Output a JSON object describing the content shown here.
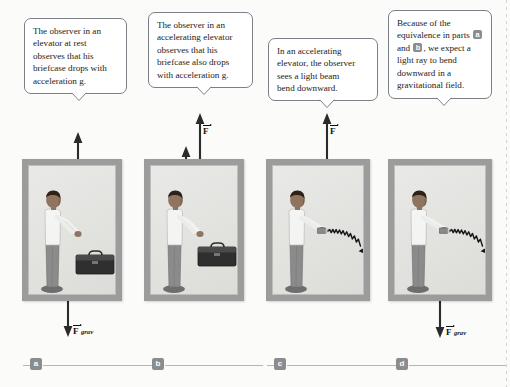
{
  "figure": {
    "background_color": "#fbfbfa",
    "frame_color": "#9c9c9c",
    "interior_color": "#e6e6e3",
    "badge_color": "#8c8c8c"
  },
  "callouts": [
    {
      "id": "callout-a",
      "text_lines": [
        "The observer in an",
        "elevator at rest",
        "observes that his",
        "briefcase drops with",
        "acceleration g."
      ],
      "plain_text": "The observer in an elevator at rest observes that his briefcase drops with acceleration g."
    },
    {
      "id": "callout-b",
      "text_lines": [
        "The observer in an",
        "accelerating elevator",
        "observes that his",
        "briefcase also drops",
        "with acceleration g."
      ],
      "plain_text": "The observer in an accelerating elevator observes that his briefcase also drops with acceleration g."
    },
    {
      "id": "callout-c",
      "text_lines": [
        "In an accelerating",
        "elevator, the observer",
        "sees a light beam",
        "bend downward."
      ],
      "plain_text": "In an accelerating elevator, the observer sees a light beam bend downward."
    },
    {
      "id": "callout-d",
      "text_prefix": "Because of the equivalence in parts",
      "badge_1": "a",
      "conjunction": "and",
      "badge_2": "b",
      "text_suffix": ", we expect a light ray to bend downward in a gravitational field.",
      "plain_text": "Because of the equivalence in parts a and b, we expect a light ray to bend downward in a gravitational field."
    }
  ],
  "panels": [
    {
      "id": "panel-a",
      "label": "a",
      "scenario": "elevator at rest",
      "person": {
        "holding": "briefcase",
        "shirt": "white",
        "trousers": "gray"
      },
      "objects": [
        "briefcase"
      ],
      "vectors": [
        {
          "name": "n",
          "symbol": "n",
          "subscript": "",
          "direction": "up",
          "position": "top"
        },
        {
          "name": "F_grav",
          "symbol": "F",
          "subscript": "grav",
          "direction": "down",
          "position": "bottom"
        }
      ]
    },
    {
      "id": "panel-b",
      "label": "b",
      "scenario": "accelerating elevator",
      "person": {
        "holding": "briefcase",
        "shirt": "white",
        "trousers": "gray"
      },
      "objects": [
        "briefcase"
      ],
      "vectors": [
        {
          "name": "F",
          "symbol": "F",
          "subscript": "",
          "direction": "up",
          "position": "top-outside"
        },
        {
          "name": "n",
          "symbol": "n",
          "subscript": "",
          "direction": "up",
          "position": "top"
        }
      ]
    },
    {
      "id": "panel-c",
      "label": "c",
      "scenario": "accelerating elevator with light beam",
      "person": {
        "holding": "flashlight",
        "shirt": "white",
        "trousers": "gray"
      },
      "objects": [
        "flashlight",
        "light-beam"
      ],
      "vectors": [
        {
          "name": "F",
          "symbol": "F",
          "subscript": "",
          "direction": "up",
          "position": "top-outside"
        }
      ],
      "beam": {
        "shape": "wavy",
        "curve": "downward",
        "arrowhead": true
      }
    },
    {
      "id": "panel-d",
      "label": "d",
      "scenario": "light ray bending in gravitational field",
      "person": {
        "holding": "flashlight",
        "shirt": "white",
        "trousers": "gray"
      },
      "objects": [
        "flashlight",
        "light-beam"
      ],
      "vectors": [
        {
          "name": "F_grav",
          "symbol": "F",
          "subscript": "grav",
          "direction": "down",
          "position": "bottom"
        }
      ],
      "beam": {
        "shape": "wavy",
        "curve": "downward",
        "arrowhead": true
      }
    }
  ],
  "part_labels": [
    {
      "id": "part-a",
      "label": "a"
    },
    {
      "id": "part-b",
      "label": "b"
    },
    {
      "id": "part-c",
      "label": "c"
    },
    {
      "id": "part-d",
      "label": "d"
    }
  ]
}
